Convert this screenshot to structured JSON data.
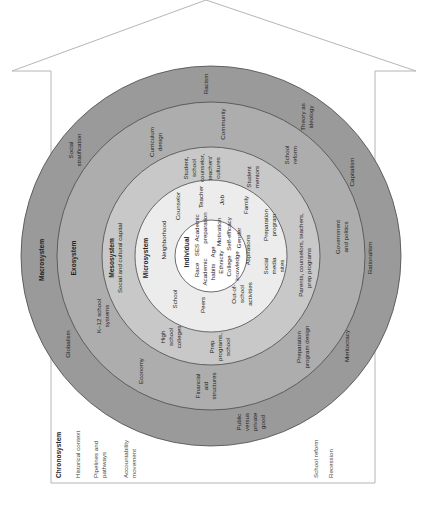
{
  "house": {
    "outline_color": "#b5b5b5",
    "roof": {
      "peak": [
        206,
        0
      ],
      "left_eave": [
        12,
        71
      ],
      "right_eave": [
        416,
        71
      ]
    },
    "walls": {
      "left_x": 51,
      "right_x": 375,
      "top_y": 71,
      "bottom_y": 483
    }
  },
  "rings": {
    "center": [
      211,
      256
    ],
    "levels": [
      {
        "name": "Macrosystem",
        "radius": 190,
        "color": "#9a9a9a"
      },
      {
        "name": "Exosystem",
        "radius": 154,
        "color": "#adadad"
      },
      {
        "name": "Mesosystem",
        "radius": 109,
        "color": "#c8c8c8"
      },
      {
        "name": "Microsystem",
        "radius": 76,
        "color": "#ececec"
      },
      {
        "name": "Individual",
        "radius": 36,
        "color": "#ffffff"
      }
    ],
    "ring_line_color": "#4a4a4a"
  },
  "labels": {
    "macrosystem": {
      "title": "Macrosystem",
      "items": [
        "Racism",
        "Theory as",
        "ideology",
        "Capitalism",
        "Rationalism",
        "Meritocracy",
        "Public",
        "versus",
        "private",
        "good",
        "Globalism",
        "Social",
        "stratification"
      ]
    },
    "exosystem": {
      "title": "Exosystem",
      "items": [
        "Community",
        "Curriculum",
        "design",
        "School",
        "reform",
        "Government",
        "and politics",
        "Preparation",
        "program design",
        "Economy",
        "K–12 school",
        "systems"
      ]
    },
    "mesosystem": {
      "title": "Mesosystem",
      "subtitle": "Social and cultural capital",
      "items": [
        "Student,",
        "school",
        "counselor,",
        "teachers'",
        "cultures",
        "Student",
        "mentors",
        "Parents, counselors, teachers,",
        "prep programs",
        "Prep",
        "programs,",
        "school",
        "Financial",
        "aid",
        "structures",
        "High",
        "school",
        "colleges"
      ]
    },
    "microsystem": {
      "title": "Microsystem",
      "items": [
        "Neighborhood",
        "Counselor",
        "Teacher",
        "Job",
        "Family",
        "Preparation",
        "program",
        "Social",
        "media",
        "sites",
        "Out-of-",
        "school",
        "activities",
        "Peers",
        "School"
      ]
    },
    "individual": {
      "title": "Individual",
      "items": [
        "Race",
        "SES",
        "Academic",
        "preparation",
        "Academic",
        "habits",
        "Age",
        "Motivation",
        "Ethnicity",
        "Self-efficacy",
        "College",
        "knowledge",
        "Gender",
        "Aspirations"
      ]
    },
    "chronosystem": {
      "title": "Chronosystem",
      "items": [
        "Historical context",
        "Pipelines and",
        "pathways",
        "Accountability",
        "movement",
        "School reform",
        "Recession"
      ]
    }
  }
}
